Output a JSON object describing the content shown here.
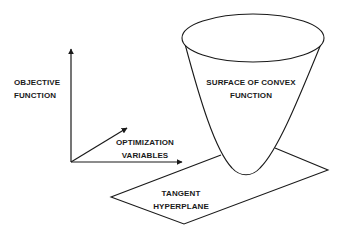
{
  "diagram": {
    "axes": {
      "vertical_label_line1": "OBJECTIVE",
      "vertical_label_line2": "FUNCTION",
      "horizontal_label_line1": "OPTIMIZATION",
      "horizontal_label_line2": "VARIABLES"
    },
    "surface": {
      "label_line1": "SURFACE OF CONVEX",
      "label_line2": "FUNCTION"
    },
    "plane": {
      "label_line1": "TANGENT",
      "label_line2": "HYPERPLANE"
    },
    "colors": {
      "stroke": "#1a1a1a",
      "background": "#ffffff",
      "text": "#1a1a1a"
    }
  }
}
